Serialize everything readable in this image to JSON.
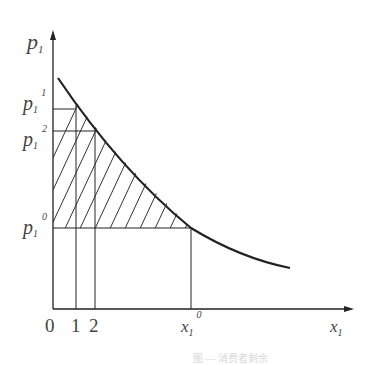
{
  "figure": {
    "y_axis_label": {
      "base": "p",
      "sub": "1"
    },
    "x_axis_label": {
      "base": "x",
      "sub": "1"
    },
    "y_ticks": [
      {
        "base": "p",
        "sub": "1",
        "sup": "1"
      },
      {
        "base": "p",
        "sub": "1",
        "sup": "2"
      },
      {
        "base": "p",
        "sub": "1",
        "sup": "0"
      }
    ],
    "x_ticks": [
      "0",
      "1",
      "2"
    ],
    "x_tick_special": {
      "base": "x",
      "sub": "1",
      "sup": "0"
    },
    "curve": "downward-sloping demand curve",
    "shaded_region": "area under demand curve above p1^0 (consumer surplus), hatched",
    "caption": "图 — 消费者剩余"
  },
  "colors": {
    "line": "#222222",
    "label": "#444444",
    "background": "#ffffff"
  }
}
